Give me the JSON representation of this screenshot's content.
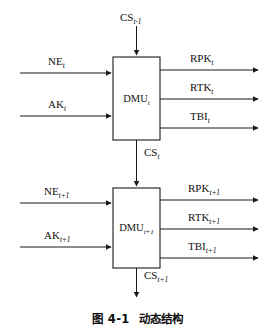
{
  "figure": {
    "caption_number": "图 4-1",
    "caption_title": "动态结构",
    "type": "block-diagram"
  },
  "blocks": [
    {
      "id": "dmu-t",
      "label_main": "DMU",
      "label_sub": "t"
    },
    {
      "id": "dmu-t1",
      "label_main": "DMU",
      "label_sub": "t+1"
    }
  ],
  "signals": {
    "state_top": {
      "main": "CS",
      "sub": "t-1"
    },
    "state_mid": {
      "main": "CS",
      "sub": "t"
    },
    "state_bottom": {
      "main": "CS",
      "sub": "t+1"
    },
    "inputs_top": [
      {
        "main": "NE",
        "sub": "t"
      },
      {
        "main": "AK",
        "sub": "t"
      }
    ],
    "inputs_bottom": [
      {
        "main": "NE",
        "sub": "t+1"
      },
      {
        "main": "AK",
        "sub": "t+1"
      }
    ],
    "outputs_top": [
      {
        "main": "RPK",
        "sub": "t"
      },
      {
        "main": "RTK",
        "sub": "t"
      },
      {
        "main": "TBI",
        "sub": "t"
      }
    ],
    "outputs_bottom": [
      {
        "main": "RPK",
        "sub": "t+1"
      },
      {
        "main": "RTK",
        "sub": "t+1"
      },
      {
        "main": "TBI",
        "sub": "t+1"
      }
    ]
  },
  "colors": {
    "stroke": "#1a1a1a",
    "text": "#111111",
    "background": "#ffffff"
  }
}
